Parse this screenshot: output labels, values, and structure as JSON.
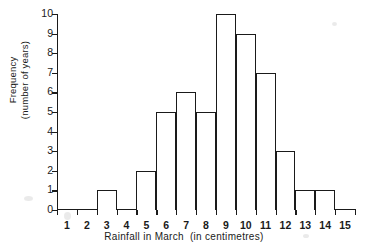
{
  "chart_data": {
    "type": "bar",
    "title": "",
    "xlabel": "Rainfall in March  (in centimetres)",
    "xlabel_main": "Rainfall in March",
    "xlabel_unit": "(in centimetres)",
    "ylabel": "Frequency (number of years)",
    "ylabel_line1": "Frequency",
    "ylabel_line2": "(number of years)",
    "categories": [
      "1",
      "2",
      "3",
      "4",
      "5",
      "6",
      "7",
      "8",
      "9",
      "10",
      "11",
      "12",
      "13",
      "14",
      "15"
    ],
    "values": [
      0,
      0,
      1,
      0,
      2,
      5,
      6,
      5,
      10,
      9,
      7,
      3,
      1,
      1,
      0
    ],
    "bin_edges": [
      0.5,
      1.5,
      2.5,
      3.5,
      4.5,
      5.5,
      6.5,
      7.5,
      8.5,
      9.5,
      10.5,
      11.5,
      12.5,
      13.5,
      14.5,
      15.5
    ],
    "xlim": [
      0.5,
      15.5
    ],
    "ylim": [
      0,
      10
    ],
    "ytick_labels": [
      "0",
      "1",
      "2",
      "3",
      "4",
      "5",
      "6",
      "7",
      "8",
      "9",
      "10"
    ],
    "ytick_values": [
      0,
      1,
      2,
      3,
      4,
      5,
      6,
      7,
      8,
      9,
      10
    ],
    "xtick_labels": [
      "1",
      "2",
      "3",
      "4",
      "5",
      "6",
      "7",
      "8",
      "9",
      "10",
      "11",
      "12",
      "13",
      "14",
      "15"
    ],
    "grid": false,
    "legend": null,
    "bar_fill_color": "#ffffff",
    "bar_edge_color": "#1a1a1a",
    "axis_color": "#1a1a1a",
    "background_color": "#ffffff"
  }
}
